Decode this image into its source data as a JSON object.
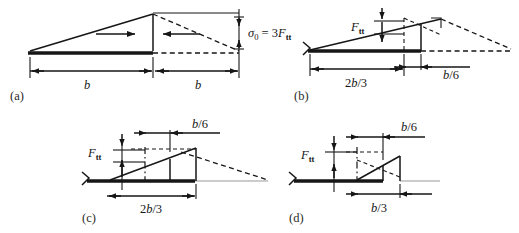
{
  "figure": {
    "type": "engineering-diagram",
    "panel_count": 4
  },
  "panels": [
    {
      "id": "a",
      "label": "(a)",
      "annotations": {
        "stress_symbol": "σ",
        "stress_subscript": "0",
        "stress_equals": " = 3",
        "force_symbol": "F",
        "force_subscript": "tt",
        "stress_full": "σ0 = 3Ftt"
      },
      "dimensions": [
        {
          "name": "left-span",
          "text": "b",
          "italic": true
        },
        {
          "name": "right-span",
          "text": "b",
          "italic": true
        }
      ],
      "arrows": [
        "right-arrow",
        "left-arrow"
      ],
      "description": "Full triangular stress block over span b with mirrored dashed triangle over adjacent span b"
    },
    {
      "id": "b",
      "label": "(b)",
      "annotations": {
        "force_symbol": "F",
        "force_subscript": "tt"
      },
      "dimensions": [
        {
          "name": "base-span",
          "text_pre": "2",
          "text_var": "b",
          "text_post": "/3"
        },
        {
          "name": "offset-span",
          "text_pre": "",
          "text_var": "b",
          "text_post": "/6"
        }
      ],
      "description": "Partial triangular stress block of length 2b/3 with eccentricity b/6"
    },
    {
      "id": "c",
      "label": "(c)",
      "annotations": {
        "force_symbol": "F",
        "force_subscript": "tt"
      },
      "dimensions": [
        {
          "name": "base-span",
          "text_pre": "2",
          "text_var": "b",
          "text_post": "/3"
        },
        {
          "name": "offset-span",
          "text_pre": "",
          "text_var": "b",
          "text_post": "/6"
        }
      ],
      "description": "Stress block length 2b/3 with b/6 offset measured above"
    },
    {
      "id": "d",
      "label": "(d)",
      "annotations": {
        "force_symbol": "F",
        "force_subscript": "tt"
      },
      "dimensions": [
        {
          "name": "base-span",
          "text_pre": "",
          "text_var": "b",
          "text_post": "/3"
        },
        {
          "name": "offset-span",
          "text_pre": "",
          "text_var": "b",
          "text_post": "/6"
        }
      ],
      "description": "Reduced stress block length b/3 with b/6 offset"
    }
  ],
  "colors": {
    "ink": "#161616",
    "faint": "#9a9a9a",
    "background": "#ffffff"
  }
}
